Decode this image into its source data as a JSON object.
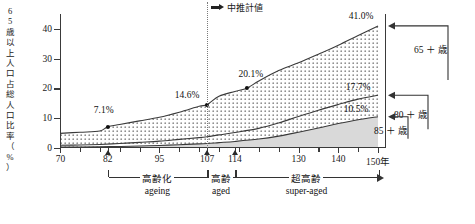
{
  "chart_data": {
    "type": "area",
    "title": "",
    "xlabel": "",
    "ylabel": "65歳以上人口占総人口比率（%）",
    "ylim": [
      0,
      45
    ],
    "xlim": [
      70,
      152
    ],
    "grid": false,
    "legend": "right-annotations",
    "y_ticks": [
      "0",
      "10",
      "20",
      "30",
      "40"
    ],
    "y_tick_values": [
      0,
      10,
      20,
      30,
      40
    ],
    "x_ticks": [
      "70",
      "82",
      "95",
      "107",
      "114",
      "130",
      "140",
      "150年"
    ],
    "x_tick_values": [
      70,
      82,
      95,
      107,
      114,
      130,
      140,
      150
    ],
    "x_minor_step": 5,
    "projection_divider": {
      "x_value": 107,
      "label": "中推計値",
      "arrow_icon": "right-arrow-icon"
    },
    "series": [
      {
        "name": "65＋歳",
        "fill": "dotted",
        "x": [
          70,
          75,
          80,
          82,
          85,
          90,
          95,
          100,
          105,
          107,
          110,
          114,
          117,
          120,
          125,
          130,
          135,
          140,
          145,
          150
        ],
        "values": [
          4.9,
          5.3,
          5.7,
          7.1,
          7.9,
          9.1,
          10.3,
          12.0,
          14.0,
          14.6,
          17.4,
          19.0,
          20.1,
          22.5,
          26.0,
          28.6,
          31.5,
          34.5,
          37.8,
          41.0
        ]
      },
      {
        "name": "80＋歳",
        "fill": "none",
        "x": [
          70,
          75,
          80,
          85,
          90,
          95,
          100,
          105,
          107,
          110,
          114,
          120,
          125,
          130,
          135,
          140,
          145,
          150
        ],
        "values": [
          0.9,
          1.0,
          1.2,
          1.5,
          1.9,
          2.3,
          2.9,
          3.5,
          3.8,
          4.4,
          5.2,
          6.6,
          8.4,
          10.6,
          12.7,
          14.6,
          16.4,
          17.7
        ]
      },
      {
        "name": "85＋歳",
        "fill": "solid-gray",
        "x": [
          70,
          75,
          80,
          85,
          90,
          95,
          100,
          105,
          107,
          110,
          114,
          120,
          125,
          130,
          135,
          140,
          145,
          150
        ],
        "values": [
          0.3,
          0.35,
          0.4,
          0.5,
          0.65,
          0.85,
          1.1,
          1.4,
          1.5,
          1.8,
          2.2,
          3.0,
          4.0,
          5.3,
          6.7,
          8.2,
          9.5,
          10.5
        ]
      }
    ],
    "point_labels": [
      {
        "text": "7.1%",
        "x_value": 82,
        "y_value": 7.1,
        "series": "65＋歳",
        "dot": true
      },
      {
        "text": "14.6%",
        "x_value": 107,
        "y_value": 14.6,
        "series": "65＋歳",
        "dot": true
      },
      {
        "text": "20.1%",
        "x_value": 117,
        "y_value": 20.1,
        "series": "65＋歳",
        "dot": true
      },
      {
        "text": "41.0%",
        "x_value": 150,
        "y_value": 41.0,
        "series": "65＋歳",
        "dot": false
      },
      {
        "text": "17.7%",
        "x_value": 150,
        "y_value": 17.7,
        "series": "80＋歳",
        "dot": false
      },
      {
        "text": "10.5%",
        "x_value": 150,
        "y_value": 10.5,
        "series": "85＋歳",
        "dot": false
      }
    ],
    "axis_markers": [
      {
        "x_value": 82,
        "shape": "triangle"
      },
      {
        "x_value": 107,
        "shape": "triangle"
      },
      {
        "x_value": 114,
        "shape": "triangle"
      }
    ],
    "phase_brackets": [
      {
        "label_ja": "高齢化",
        "label_en": "ageing",
        "from": 82,
        "to": 107,
        "arrow": false
      },
      {
        "label_ja": "高齢",
        "label_en": "aged",
        "from": 107,
        "to": 114,
        "arrow": false
      },
      {
        "label_ja": "超高齢",
        "label_en": "super-aged",
        "from": 114,
        "to": 150,
        "arrow": true
      }
    ],
    "right_annotations": [
      {
        "label": "65 ＋ 歳",
        "y_value": 41.0,
        "arrow_icon": "left-arrow-icon"
      },
      {
        "label": "80 ＋ 歳",
        "y_value": 17.7,
        "arrow_icon": "left-arrow-icon"
      },
      {
        "label": "85 ＋ 歳",
        "y_value": 10.5,
        "arrow_icon": "left-arrow-icon"
      }
    ]
  }
}
